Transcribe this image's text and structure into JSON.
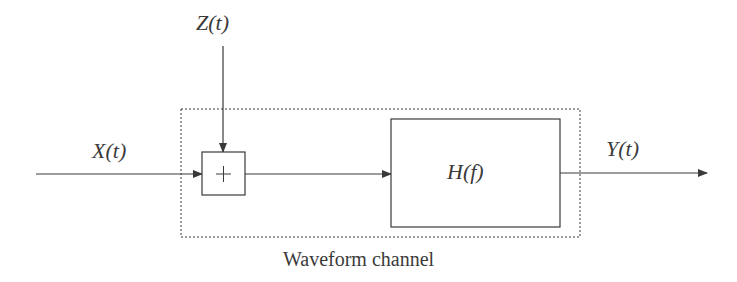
{
  "diagram": {
    "input_label": "X(t)",
    "noise_label": "Z(t)",
    "output_label": "Y(t)",
    "adder_symbol": "+",
    "filter_label": "H(f)",
    "channel_caption": "Waveform channel",
    "colors": {
      "stroke": "#3a3a3a",
      "background": "#ffffff"
    },
    "nodes": [
      {
        "id": "input",
        "label": "X(t)"
      },
      {
        "id": "noise",
        "label": "Z(t)"
      },
      {
        "id": "adder",
        "label": "+"
      },
      {
        "id": "filter",
        "label": "H(f)"
      },
      {
        "id": "output",
        "label": "Y(t)"
      }
    ],
    "edges": [
      {
        "from": "input",
        "to": "adder"
      },
      {
        "from": "noise",
        "to": "adder"
      },
      {
        "from": "adder",
        "to": "filter"
      },
      {
        "from": "filter",
        "to": "output"
      }
    ],
    "groups": [
      {
        "label": "Waveform channel",
        "contains": [
          "adder",
          "filter"
        ],
        "style": "dashed"
      }
    ]
  }
}
